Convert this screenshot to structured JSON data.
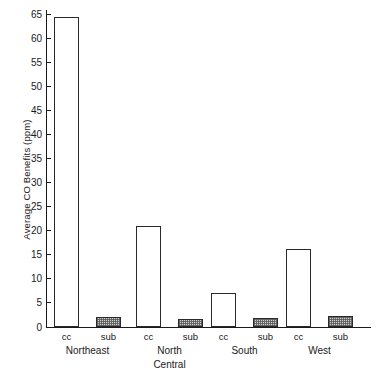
{
  "chart_data": {
    "type": "bar",
    "title": "",
    "subtitle": "",
    "xlabel": "",
    "ylabel": "Average CO Benefits (ppm)",
    "ylim": [
      0,
      65
    ],
    "ytick_step": 5,
    "yticks": [
      0,
      5,
      10,
      15,
      20,
      25,
      30,
      35,
      40,
      45,
      50,
      55,
      60,
      65
    ],
    "ytick_labels": [
      "0",
      "5",
      "10",
      "15",
      "20",
      "25",
      "30",
      "35",
      "40",
      "45",
      "50",
      "55",
      "60",
      "65"
    ],
    "grid": false,
    "legend": false,
    "legend_position": "none",
    "categories": [
      "Northeast",
      "North Central",
      "South",
      "West"
    ],
    "category_label_lines": [
      [
        "Northeast"
      ],
      [
        "North",
        "Central"
      ],
      [
        "South"
      ],
      [
        "West"
      ]
    ],
    "bar_tick_labels": [
      "cc",
      "sub",
      "cc",
      "sub",
      "cc",
      "sub",
      "cc",
      "sub"
    ],
    "series": [
      {
        "name": "cc",
        "label": "cc",
        "fill": "open",
        "color": "#ffffff",
        "edge_color": "#2a2a2a",
        "values": [
          64.3,
          21.0,
          7.0,
          16.3
        ]
      },
      {
        "name": "sub",
        "label": "sub",
        "fill": "stippled",
        "color": "#cfcfcf",
        "edge_color": "#2a2a2a",
        "values": [
          2.1,
          1.7,
          1.8,
          2.2
        ]
      }
    ],
    "bars": [
      {
        "group": "Northeast",
        "series": "cc",
        "label": "cc",
        "value": 64.3
      },
      {
        "group": "Northeast",
        "series": "sub",
        "label": "sub",
        "value": 2.1
      },
      {
        "group": "North Central",
        "series": "cc",
        "label": "cc",
        "value": 21.0
      },
      {
        "group": "North Central",
        "series": "sub",
        "label": "sub",
        "value": 1.7
      },
      {
        "group": "South",
        "series": "cc",
        "label": "cc",
        "value": 7.0
      },
      {
        "group": "South",
        "series": "sub",
        "label": "sub",
        "value": 1.8
      },
      {
        "group": "West",
        "series": "cc",
        "label": "cc",
        "value": 16.3
      },
      {
        "group": "West",
        "series": "sub",
        "label": "sub",
        "value": 2.2
      }
    ]
  }
}
